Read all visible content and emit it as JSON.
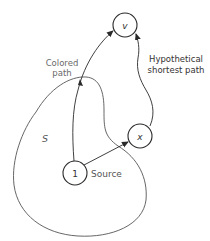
{
  "diagram": {
    "colors": {
      "background": "#ffffff",
      "stroke": "#2a2a2a",
      "boundary": "#555555",
      "label_gray": "#6a6a6a",
      "label_dark": "#333333"
    },
    "nodes": [
      {
        "id": "v",
        "label": "v",
        "cx": 125,
        "cy": 25,
        "r": 12
      },
      {
        "id": "x",
        "label": "x",
        "cx": 140,
        "cy": 136,
        "r": 12
      },
      {
        "id": "1",
        "label": "1",
        "cx": 75,
        "cy": 173,
        "r": 12
      }
    ],
    "region_label": "S",
    "source_label": "Source",
    "colored_path_label_line1": "Colored",
    "colored_path_label_line2": "path",
    "hypothetical_label_line1": "Hypothetical",
    "hypothetical_label_line2": "shortest path",
    "edges": [
      {
        "from": "1",
        "to": "v",
        "type": "colored path"
      },
      {
        "from": "1",
        "to": "x",
        "type": "edge"
      },
      {
        "from": "x",
        "to": "v",
        "type": "hypothetical shortest path"
      }
    ]
  }
}
